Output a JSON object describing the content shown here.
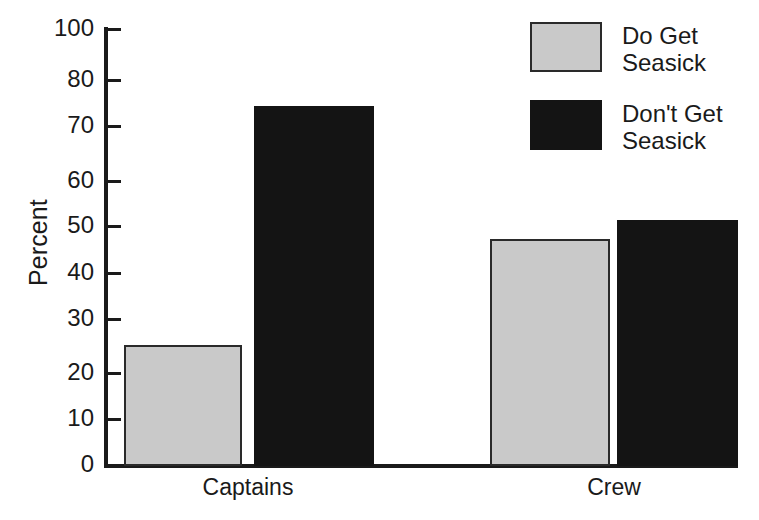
{
  "chart_data": {
    "type": "bar",
    "title": "",
    "xlabel": "",
    "ylabel": "Percent",
    "categories": [
      "Captains",
      "Crew"
    ],
    "series": [
      {
        "name": "Do Get Seasick",
        "values": [
          25,
          47.5
        ],
        "color": "#c9c9c9"
      },
      {
        "name": "Don't Get Seasick",
        "values": [
          75,
          51.5
        ],
        "color": "#141414"
      }
    ],
    "ylim": [
      0,
      100
    ],
    "ytick_labels": [
      "0",
      "10",
      "20",
      "30",
      "40",
      "50",
      "60",
      "70",
      "80",
      "100"
    ],
    "ytick_values": [
      0,
      10,
      20,
      30,
      40,
      50,
      60,
      70,
      80,
      100
    ],
    "grid": false,
    "legend_position": "top-right"
  },
  "axis": {
    "y_title": "Percent",
    "ticks": [
      {
        "label": "100",
        "y": 29
      },
      {
        "label": "80",
        "y": 80
      },
      {
        "label": "70",
        "y": 126
      },
      {
        "label": "60",
        "y": 181
      },
      {
        "label": "50",
        "y": 226
      },
      {
        "label": "40",
        "y": 273
      },
      {
        "label": "30",
        "y": 319
      },
      {
        "label": "20",
        "y": 373
      },
      {
        "label": "10",
        "y": 419
      },
      {
        "label": "0",
        "y": 465
      }
    ]
  },
  "bars": [
    {
      "id": "captains-do-get",
      "group": "Captains",
      "series": "Do Get Seasick",
      "value": 25,
      "style": "light",
      "x": 124,
      "width": 118,
      "top": 345,
      "height": 121
    },
    {
      "id": "captains-dont-get",
      "group": "Captains",
      "series": "Don't Get Seasick",
      "value": 75,
      "style": "dark",
      "x": 254,
      "width": 120,
      "top": 106,
      "height": 360
    },
    {
      "id": "crew-do-get",
      "group": "Crew",
      "series": "Do Get Seasick",
      "value": 47.5,
      "style": "light",
      "x": 490,
      "width": 120,
      "top": 239,
      "height": 227
    },
    {
      "id": "crew-dont-get",
      "group": "Crew",
      "series": "Don't Get Seasick",
      "value": 51.5,
      "style": "dark",
      "x": 617,
      "width": 121,
      "top": 220,
      "height": 246
    }
  ],
  "x_labels": [
    {
      "text": "Captains",
      "left": 168,
      "width": 160
    },
    {
      "text": "Crew",
      "left": 534,
      "width": 160
    }
  ],
  "legend": {
    "items": [
      {
        "label": "Do Get\nSeasick",
        "style": "light",
        "top": 0,
        "color": "#c9c9c9"
      },
      {
        "label": "Don't Get\nSeasick",
        "style": "dark",
        "top": 78,
        "color": "#141414"
      }
    ]
  }
}
